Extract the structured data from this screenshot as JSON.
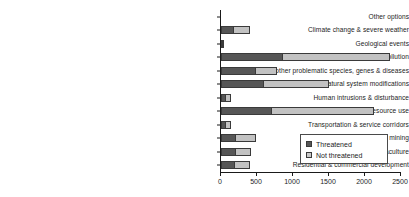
{
  "chart_data": {
    "type": "bar",
    "orientation": "horizontal",
    "stacked": true,
    "title": "",
    "subtitle": "",
    "xlabel": "",
    "ylabel": "",
    "xlim": [
      0,
      2500
    ],
    "xticks": [
      0,
      500,
      1000,
      1500,
      2000,
      2500
    ],
    "xticklabels": [
      "0",
      "500",
      "1000",
      "1500",
      "2000",
      "2500"
    ],
    "grid": false,
    "legend_position": "lower-right",
    "categories": [
      "Other options",
      "Climate change & severe weather",
      "Geological events",
      "Pollution",
      "Invasive and other problematic species, genes & diseases",
      "Natural system modifications",
      "Human intrusions & disturbance",
      "Biological resource use",
      "Transportation & service corridors",
      "Energy production & mining",
      "Agriculture & aquaculture",
      "Residential & commercial development"
    ],
    "series": [
      {
        "name": "Threatened",
        "color": "#565656",
        "values": [
          0,
          170,
          20,
          850,
          470,
          590,
          55,
          700,
          60,
          190,
          190,
          175
        ]
      },
      {
        "name": "Not threatened",
        "color": "#c2c2c2",
        "values": [
          0,
          230,
          10,
          1500,
          310,
          910,
          85,
          1430,
          80,
          290,
          230,
          230
        ]
      }
    ],
    "totals": [
      0,
      400,
      30,
      2350,
      780,
      1500,
      140,
      2130,
      140,
      480,
      420,
      405
    ]
  },
  "legend": {
    "entries": [
      {
        "label": "Threatened",
        "swatch": "threatened"
      },
      {
        "label": "Not threatened",
        "swatch": "notthreatened"
      }
    ]
  }
}
